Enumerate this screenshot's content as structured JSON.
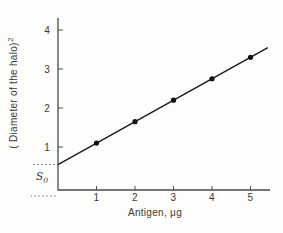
{
  "chart_data": {
    "type": "scatter",
    "title": "",
    "xlabel": "Antigen, μg",
    "ylabel_base": "( Diameter of the halo)",
    "ylabel_exponent": "2",
    "x": [
      1,
      2,
      3,
      4,
      5
    ],
    "y": [
      1.1,
      1.65,
      2.2,
      2.75,
      3.3
    ],
    "fit_line": {
      "intercept": 0.55,
      "slope": 0.55,
      "x_start": 0,
      "x_end": 5.45
    },
    "x_ticks": [
      1,
      2,
      3,
      4,
      5
    ],
    "y_ticks": [
      1,
      2,
      3,
      4
    ],
    "xlim": [
      0,
      5.5
    ],
    "ylim": [
      0,
      4.5
    ],
    "grid": false,
    "legend": null,
    "annotation": {
      "label_base": "S",
      "label_sub": "0",
      "intercept_level": 0.55,
      "baseline_level": 0
    },
    "colors": {
      "line": "#1c1c1c",
      "point": "#111111",
      "axis": "#4a4a4a",
      "text": "#3a3a3a",
      "dashed": "#9a9a9a",
      "background": "#fdfdfb"
    }
  }
}
